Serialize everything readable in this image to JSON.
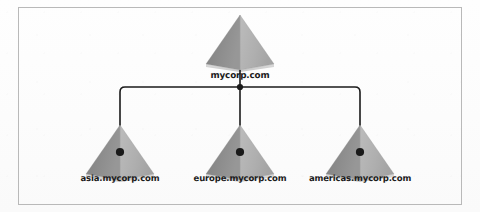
{
  "diagram": {
    "type": "tree",
    "background_color": "#fdfdfd",
    "frame_color": "#b9b9b9",
    "connector_color": "#1a1a1a",
    "pyramid_left_face_color": "#8d8d8d",
    "pyramid_right_face_color": "#b0b0b0",
    "pyramid_base_color": "#d6d6d6",
    "label_color": "#1b1b1b"
  },
  "root": {
    "label": "mycorp.com",
    "icon": "pyramid-icon"
  },
  "children": [
    {
      "label": "asia.mycorp.com",
      "icon": "pyramid-icon"
    },
    {
      "label": "europe.mycorp.com",
      "icon": "pyramid-icon"
    },
    {
      "label": "americas.mycorp.com",
      "icon": "pyramid-icon"
    }
  ]
}
